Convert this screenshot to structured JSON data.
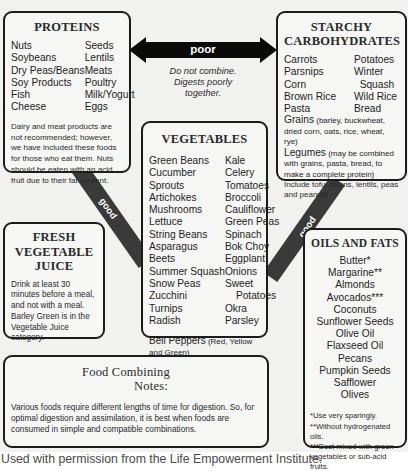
{
  "proteins": {
    "title": "PROTEINS",
    "col1": [
      "Nuts",
      "Soybeans",
      "Dry Peas/Beans",
      "Soy Products",
      "Fish",
      "Cheese"
    ],
    "col2": [
      "Seeds",
      "Lentils",
      "Meats",
      "Poultry",
      "Milk/Yogurt",
      "Eggs"
    ],
    "note": "Dairy and meat products are not recommended; however, we have included these foods for those who eat them. Nuts should be eaten with an acid fruit due to their fat content."
  },
  "poor_arrow": {
    "label": "poor",
    "caption_line1": "Do not combine.",
    "caption_line2": "Digests poorly",
    "caption_line3": "together."
  },
  "starchy": {
    "title_line1": "STARCHY",
    "title_line2": "CARBOHYDRATES",
    "col1": [
      "Carrots",
      "Parsnips",
      "Corn",
      "Brown Rice",
      "Pasta"
    ],
    "col2": [
      "Potatoes",
      "Winter",
      "  Squash",
      "Wild Rice",
      "Bread"
    ],
    "grains_label": "Grains",
    "grains_note": " (barley, buckwheat, dried corn, oats, rice, wheat, rye)",
    "legumes_label": "Legumes",
    "legumes_note": " (may be combined with grains, pasta, bread, to make a complete protein)",
    "include_note": "Include tofu, beans, lentils, peas and peanuts"
  },
  "vegetables": {
    "title": "VEGETABLES",
    "col1": [
      "Green Beans",
      "Cucumber",
      "Sprouts",
      "Artichokes",
      "Mushrooms",
      "Lettuce",
      "String Beans",
      "Asparagus",
      "Beets",
      "Summer Squash",
      "Snow Peas",
      "Zucchini",
      "Turnips",
      "Radish"
    ],
    "col2": [
      "Kale",
      "Celery",
      "Tomatoes",
      "Broccoli",
      "Cauliflower",
      "Green Peas",
      "Spinach",
      "Bok Choy",
      "Eggplant",
      "Onions",
      "Sweet",
      "Potatoes",
      "Okra",
      "Parsley"
    ],
    "bell_label": "Bell Peppers",
    "bell_note": " (Red, Yellow and Green)"
  },
  "juice": {
    "title_line1": "FRESH",
    "title_line2": "VEGETABLE",
    "title_line3": "JUICE",
    "note": "Drink at least 30 minutes before a meal, and not with a meal. Barley Green is in the Vegetable Juice category."
  },
  "oils": {
    "title": "OILS AND FATS",
    "items": [
      "Butter*",
      "Margarine**",
      "Almonds",
      "Avocados***",
      "Coconuts",
      "Sunflower Seeds",
      "Olive Oil",
      "Flaxseed Oil",
      "Pecans",
      "Pumpkin Seeds",
      "Safflower",
      "Olives"
    ],
    "footnote1": "*Use very sparingly.",
    "footnote2": "**Without hydrogenated oils.",
    "footnote3": "***Best mixed with green vegetables or sub-acid fruits."
  },
  "notes": {
    "title_line1": "Food Combining",
    "title_line2": "Notes:",
    "body": "Various foods require different lengths of time for digestion. So, for optimal digestion and assimilation, it is best when foods are consumed in simple and compatible combinations."
  },
  "good_left": {
    "label": "good"
  },
  "good_right": {
    "label": "good"
  },
  "footer": {
    "credit": "Used with permission from the Life Empowerment Institute."
  },
  "colors": {
    "band": "#3a3a3a",
    "border": "#1c1c1c",
    "background": "#f1f1f0",
    "box_fill": "#f6f6f5"
  }
}
